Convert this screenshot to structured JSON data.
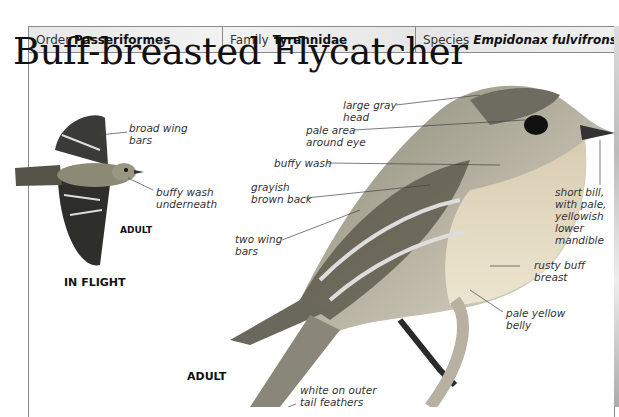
{
  "header": {
    "order_label": "Order",
    "order_value": "Passeriformes",
    "family_label": "Family",
    "family_value": "Tyrannidae",
    "species_label": "Species",
    "species_value": "Empidonax fulvifrons"
  },
  "title": "Buff-breasted Flycatcher",
  "flight": {
    "labels": [
      "broad wing",
      "bars",
      "buffy wash",
      "underneath"
    ],
    "adult_caption": "ADULT",
    "caption": "IN FLIGHT"
  },
  "main": {
    "labels": {
      "head_1": "large gray",
      "head_2": "head",
      "eye_1": "pale area",
      "eye_2": "around eye",
      "wash": "buffy wash",
      "back_1": "grayish",
      "back_2": "brown back",
      "bars_1": "two wing",
      "bars_2": "bars",
      "bill_1": "short bill,",
      "bill_2": "with pale,",
      "bill_3": "yellowish",
      "bill_4": "lower",
      "bill_5": "mandible",
      "breast_1": "rusty buff",
      "breast_2": "breast",
      "belly_1": "pale yellow",
      "belly_2": "belly",
      "tail_1": "white on outer",
      "tail_2": "tail feathers"
    },
    "adult_caption": "ADULT"
  },
  "colors": {
    "border": "#8a8a8a",
    "header_bg": "#eeeeee",
    "text": "#333333"
  }
}
